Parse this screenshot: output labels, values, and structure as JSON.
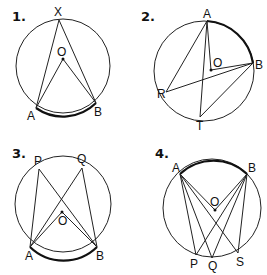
{
  "diagrams": [
    {
      "number": "1.",
      "center_label": "O",
      "points": {
        "X": "X",
        "A": "A",
        "B": "B"
      }
    },
    {
      "number": "2.",
      "center_label": "O",
      "points": {
        "A": "A",
        "B": "B",
        "R": "R",
        "T": "T"
      }
    },
    {
      "number": "3.",
      "center_label": "O",
      "points": {
        "P": "P",
        "Q": "Q",
        "A": "A",
        "B": "B"
      }
    },
    {
      "number": "4.",
      "center_label": "O",
      "points": {
        "A": "A",
        "B": "B",
        "P": "P",
        "Q": "Q",
        "S": "S"
      }
    }
  ]
}
